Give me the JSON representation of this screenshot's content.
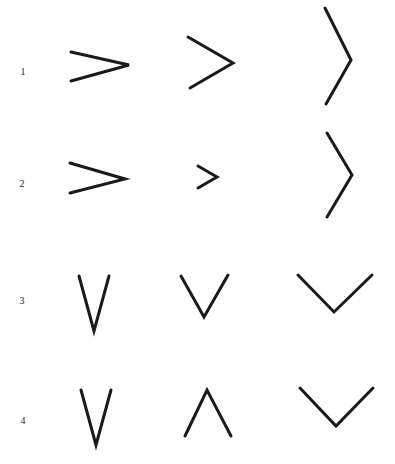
{
  "figure": {
    "stroke_color": "#1a1a1a",
    "background": "#ffffff",
    "rows": [
      {
        "label": "1",
        "label_pos": [
          23,
          72
        ],
        "shapes": [
          {
            "name": "chevron-right-wide-icon",
            "points": "71,52 129,65 71,81"
          },
          {
            "name": "chevron-right-medium-icon",
            "points": "188,37 233,63 190,88"
          },
          {
            "name": "chevron-right-tall-icon",
            "points": "325,8 351,60 326,104"
          }
        ]
      },
      {
        "label": "2",
        "label_pos": [
          22,
          184
        ],
        "shapes": [
          {
            "name": "chevron-right-wide-icon",
            "points": "70,163 125,179 70,193"
          },
          {
            "name": "chevron-right-small-icon",
            "points": "198,166 217,177 198,188"
          },
          {
            "name": "chevron-right-tall-icon",
            "points": "327,133 352,175 327,217"
          }
        ]
      },
      {
        "label": "3",
        "label_pos": [
          22,
          301
        ],
        "shapes": [
          {
            "name": "chevron-down-narrow-icon",
            "points": "79,276 94,331 109,276"
          },
          {
            "name": "chevron-down-medium-icon",
            "points": "181,276 204,317 228,275"
          },
          {
            "name": "chevron-down-wide-icon",
            "points": "298,275 334,312 372,275"
          }
        ]
      },
      {
        "label": "4",
        "label_pos": [
          23,
          421
        ],
        "shapes": [
          {
            "name": "chevron-down-narrow-icon",
            "points": "81,390 96,445 111,390"
          },
          {
            "name": "chevron-up-medium-icon",
            "points": "185,436 207,390 231,436"
          },
          {
            "name": "chevron-down-wide-icon",
            "points": "300,388 336,426 373,388"
          }
        ]
      }
    ]
  }
}
